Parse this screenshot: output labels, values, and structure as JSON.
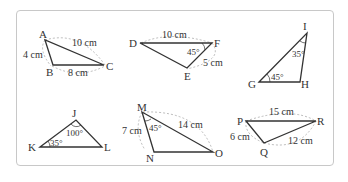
{
  "figure": {
    "colors": {
      "edge": "#333333",
      "dashed_arc": "#aaaaaa",
      "border": "#c8c8c8"
    },
    "triangles": [
      {
        "name": "ABC",
        "vertices": [
          "A",
          "B",
          "C"
        ],
        "sides": [
          {
            "between": "AB",
            "label": "4 cm"
          },
          {
            "between": "BC",
            "label": "8 cm"
          },
          {
            "between": "AC",
            "label": "10 cm"
          }
        ],
        "angles": []
      },
      {
        "name": "DEF",
        "vertices": [
          "D",
          "E",
          "F"
        ],
        "sides": [
          {
            "between": "DF",
            "label": "10 cm"
          },
          {
            "between": "EF",
            "label": "5 cm"
          }
        ],
        "angles": [
          {
            "at": "F",
            "label": "45°"
          }
        ]
      },
      {
        "name": "GHI",
        "vertices": [
          "G",
          "H",
          "I"
        ],
        "sides": [],
        "angles": [
          {
            "at": "I",
            "label": "35°"
          },
          {
            "at": "G",
            "label": "45°"
          }
        ]
      },
      {
        "name": "JKL",
        "vertices": [
          "J",
          "K",
          "L"
        ],
        "sides": [],
        "angles": [
          {
            "at": "J",
            "label": "100°"
          },
          {
            "at": "K",
            "label": "35°"
          }
        ]
      },
      {
        "name": "MNO",
        "vertices": [
          "M",
          "N",
          "O"
        ],
        "sides": [
          {
            "between": "MN",
            "label": "7 cm"
          },
          {
            "between": "MO",
            "label": "14 cm"
          }
        ],
        "angles": [
          {
            "at": "M",
            "label": "45°"
          }
        ]
      },
      {
        "name": "PQR",
        "vertices": [
          "P",
          "Q",
          "R"
        ],
        "sides": [
          {
            "between": "PR",
            "label": "15 cm"
          },
          {
            "between": "PQ",
            "label": "6 cm"
          },
          {
            "between": "QR",
            "label": "12 cm"
          }
        ],
        "angles": []
      }
    ]
  },
  "t": {
    "A": "A",
    "B": "B",
    "C": "C",
    "ab": "4 cm",
    "bc": "8 cm",
    "ac": "10 cm",
    "D": "D",
    "E": "E",
    "F": "F",
    "df": "10 cm",
    "ef": "5 cm",
    "f_ang": "45°",
    "G": "G",
    "H": "H",
    "I": "I",
    "i_ang": "35°",
    "g_ang": "45°",
    "J": "J",
    "K": "K",
    "L": "L",
    "j_ang": "100°",
    "k_ang": "35°",
    "M": "M",
    "N": "N",
    "O": "O",
    "mn": "7 cm",
    "mo": "14 cm",
    "m_ang": "45°",
    "P": "P",
    "Q": "Q",
    "R": "R",
    "pr": "15 cm",
    "pq": "6 cm",
    "qr": "12 cm"
  }
}
